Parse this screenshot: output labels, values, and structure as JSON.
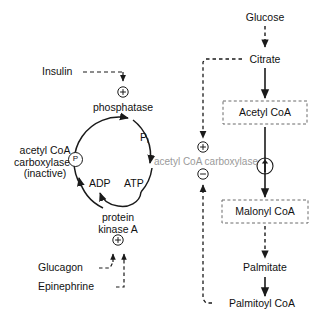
{
  "diagram": {
    "colors": {
      "stroke": "#1a1a1a",
      "enzyme_text": "#9a9a9a",
      "background": "#ffffff"
    },
    "left_cycle": {
      "hormone_activator": "Insulin",
      "enzyme_top": "phosphatase",
      "product_released": "P",
      "product_released_sub": "i",
      "inactive_form_line1": "acetyl CoA",
      "inactive_form_line2": "carboxylase",
      "inactive_form_line3": "(inactive)",
      "phospho_symbol": "P",
      "nucleotide_product": "ADP",
      "nucleotide_substrate": "ATP",
      "enzyme_bottom_line1": "protein",
      "enzyme_bottom_line2": "kinase A",
      "hormone_activators_bottom": [
        "Glucagon",
        "Epinephrine"
      ],
      "plus_symbol_top": "+",
      "plus_symbol_bottom": "+"
    },
    "center": {
      "enzyme_label": "acetyl CoA carboxylase",
      "plus_symbol": "+",
      "minus_symbol": "−"
    },
    "right_pathway": {
      "nodes": [
        {
          "label": "Glucose",
          "boxed": false
        },
        {
          "label": "Citrate",
          "boxed": false
        },
        {
          "label": "Acetyl CoA",
          "boxed": true
        },
        {
          "label": "Malonyl CoA",
          "boxed": true
        },
        {
          "label": "Palmitate",
          "boxed": false
        },
        {
          "label": "Palmitoyl CoA",
          "boxed": false
        }
      ],
      "increase_symbol": "↑"
    }
  }
}
